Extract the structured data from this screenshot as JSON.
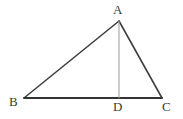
{
  "figure": {
    "name": "triangle-with-altitude",
    "background_color": "#ffffff",
    "width": 183,
    "height": 119
  },
  "style": {
    "side_color": "#3f3f3f",
    "base_color": "#333333",
    "altitude_color": "#9a9a9a",
    "label_color": "#3a3a3a",
    "side_width": 1.6,
    "base_width": 1.8,
    "altitude_width": 1
  },
  "points": {
    "A": {
      "label": "A",
      "x": 119,
      "y": 21
    },
    "B": {
      "label": "B",
      "x": 24,
      "y": 98
    },
    "C": {
      "label": "C",
      "x": 162,
      "y": 98
    },
    "D": {
      "label": "D",
      "x": 119,
      "y": 98
    }
  },
  "segments": [
    {
      "name": "side-AB",
      "from": "A",
      "to": "B",
      "kind": "side"
    },
    {
      "name": "side-AC",
      "from": "A",
      "to": "C",
      "kind": "side"
    },
    {
      "name": "base-BC",
      "from": "B",
      "to": "C",
      "kind": "base"
    },
    {
      "name": "altitude-AD",
      "from": "A",
      "to": "D",
      "kind": "altitude"
    }
  ],
  "labels": {
    "A": "A",
    "B": "B",
    "C": "C",
    "D": "D"
  }
}
